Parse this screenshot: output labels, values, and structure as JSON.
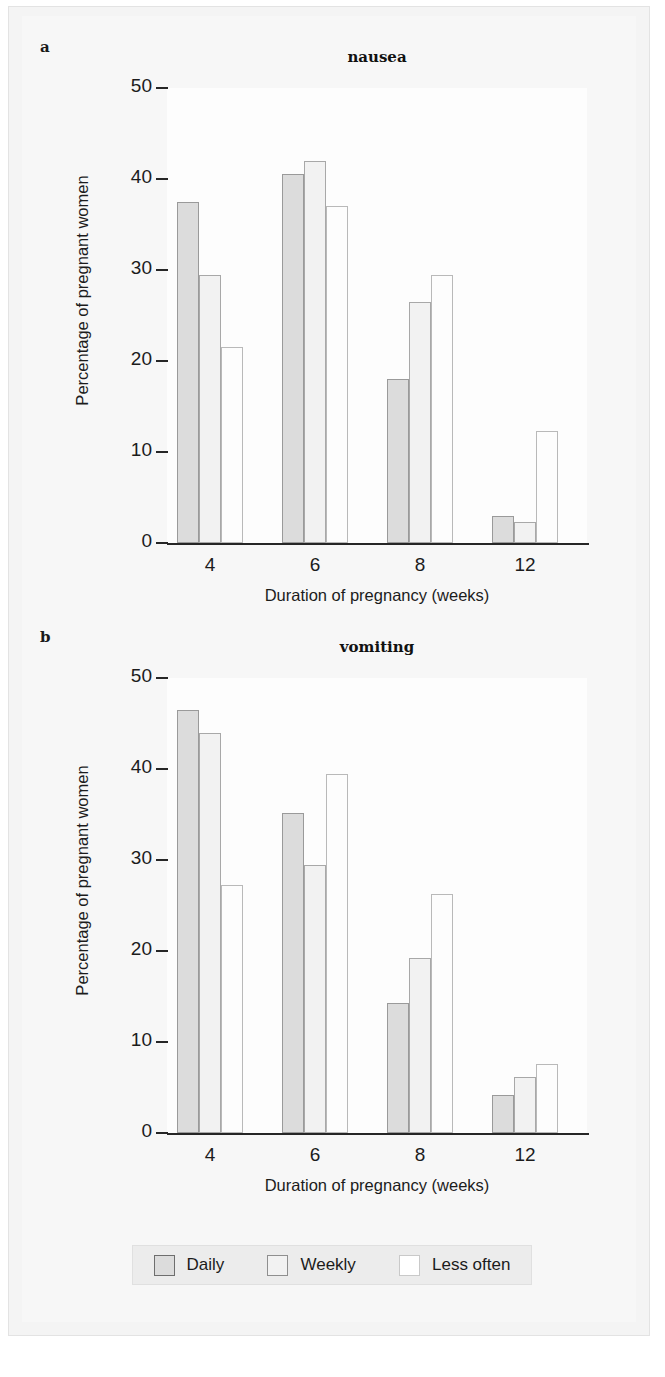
{
  "figure": {
    "panels": [
      {
        "letter": "a",
        "title": "nausea",
        "xlabel": "Duration of pregnancy (weeks)",
        "ylabel": "Percentage of pregnant women"
      },
      {
        "letter": "b",
        "title": "vomiting",
        "xlabel": "Duration of pregnancy (weeks)",
        "ylabel": "Percentage of pregnant women"
      }
    ],
    "legend": {
      "items": [
        {
          "label": "Daily",
          "swatch": "daily",
          "color": "#dcdcdc"
        },
        {
          "label": "Weekly",
          "swatch": "weekly",
          "color": "#f2f2f2"
        },
        {
          "label": "Less often",
          "swatch": "lessoften",
          "color": "#ffffff"
        }
      ]
    },
    "caption": ""
  },
  "chart_data": [
    {
      "type": "bar",
      "panel": "a",
      "title": "nausea",
      "xlabel": "Duration of pregnancy (weeks)",
      "ylabel": "Percentage of pregnant women",
      "categories": [
        "4",
        "6",
        "8",
        "12"
      ],
      "ylim": [
        0,
        50
      ],
      "yticks": [
        0,
        10,
        20,
        30,
        40,
        50
      ],
      "grid": false,
      "legend_position": "bottom",
      "series": [
        {
          "name": "Daily",
          "values": [
            37.5,
            40.5,
            18.0,
            3.0
          ]
        },
        {
          "name": "Weekly",
          "values": [
            29.5,
            42.0,
            26.5,
            2.3
          ]
        },
        {
          "name": "Less often",
          "values": [
            21.5,
            37.0,
            29.5,
            12.3
          ]
        }
      ]
    },
    {
      "type": "bar",
      "panel": "b",
      "title": "vomiting",
      "xlabel": "Duration of pregnancy (weeks)",
      "ylabel": "Percentage of pregnant women",
      "categories": [
        "4",
        "6",
        "8",
        "12"
      ],
      "ylim": [
        0,
        50
      ],
      "yticks": [
        0,
        10,
        20,
        30,
        40,
        50
      ],
      "grid": false,
      "legend_position": "bottom",
      "series": [
        {
          "name": "Daily",
          "values": [
            46.5,
            35.2,
            14.3,
            4.2
          ]
        },
        {
          "name": "Weekly",
          "values": [
            44.0,
            29.5,
            19.2,
            6.2
          ]
        },
        {
          "name": "Less often",
          "values": [
            27.3,
            39.5,
            26.3,
            7.6
          ]
        }
      ]
    }
  ]
}
